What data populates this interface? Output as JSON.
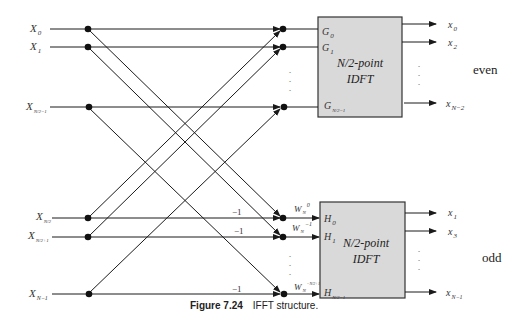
{
  "figure": {
    "caption_number": "Figure 7.24",
    "caption_text": "IFFT structure."
  },
  "inputs": [
    {
      "symbol": "X",
      "sub": "0"
    },
    {
      "symbol": "X",
      "sub": "1"
    },
    {
      "symbol": "X",
      "sub": "N/2−1"
    },
    {
      "symbol": "X",
      "sub": "N/2"
    },
    {
      "symbol": "X",
      "sub": "N/2+1"
    },
    {
      "symbol": "X",
      "sub": "N−1"
    }
  ],
  "top_block": {
    "title_line1": "N/2-point",
    "title_line2": "IDFT",
    "ports": [
      {
        "symbol": "G",
        "sub": "0"
      },
      {
        "symbol": "G",
        "sub": "1"
      },
      {
        "symbol": "G",
        "sub": "N/2−1"
      }
    ],
    "outputs": [
      {
        "symbol": "x",
        "sub": "0"
      },
      {
        "symbol": "x",
        "sub": "2"
      },
      {
        "symbol": "x",
        "sub": "N−2"
      }
    ],
    "side_label": "even"
  },
  "bottom_block": {
    "title_line1": "N/2-point",
    "title_line2": "IDFT",
    "ports": [
      {
        "symbol": "H",
        "sub": "0"
      },
      {
        "symbol": "H",
        "sub": "1"
      },
      {
        "symbol": "H",
        "sub": "N/2−1"
      }
    ],
    "twiddles": [
      {
        "symbol": "W",
        "sub": "N",
        "sup": "0"
      },
      {
        "symbol": "W",
        "sub": "N",
        "sup": "−1"
      },
      {
        "symbol": "W",
        "sub": "N",
        "sup": "−N/2+1"
      }
    ],
    "multipliers": [
      "−1",
      "−1",
      "−1"
    ],
    "outputs": [
      {
        "symbol": "x",
        "sub": "1"
      },
      {
        "symbol": "x",
        "sub": "3"
      },
      {
        "symbol": "x",
        "sub": "N−1"
      }
    ],
    "side_label": "odd"
  },
  "colors": {
    "line": "#1a1a1a",
    "block_fill": "#d9d9d9",
    "block_border": "#333333"
  }
}
